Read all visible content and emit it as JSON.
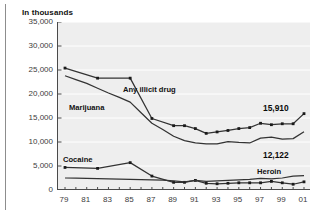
{
  "figure": {
    "title": "In thousands",
    "background": "#ffffff",
    "plot_background": "#eeeeee",
    "line_color": "#333333",
    "gridline_color": "#ffffff"
  },
  "annotations": [
    {
      "name": "any-illicit-drug",
      "label": "Any illicit drug"
    },
    {
      "name": "marijuana",
      "label": "Marijuana"
    },
    {
      "name": "cocaine",
      "label": "Cocaine"
    },
    {
      "name": "heroin",
      "label": "Heroin"
    }
  ],
  "end_labels": [
    {
      "name": "any-illicit-drug-value",
      "label": "15,910"
    },
    {
      "name": "marijuana-value",
      "label": "12,122"
    }
  ],
  "chart_data": {
    "type": "line",
    "title": "In thousands",
    "xlabel": "",
    "ylabel": "In thousands",
    "ylim": [
      0,
      35000
    ],
    "yticks": [
      0,
      5000,
      10000,
      15000,
      20000,
      25000,
      30000,
      35000
    ],
    "ytick_labels": [
      "0",
      "5,000",
      "10,000",
      "15,000",
      "20,000",
      "25,000",
      "30,000",
      "35,000"
    ],
    "grid": true,
    "legend": "inline-annotations",
    "x": [
      1979,
      1980,
      1981,
      1982,
      1983,
      1984,
      1985,
      1986,
      1987,
      1988,
      1989,
      1990,
      1991,
      1992,
      1993,
      1994,
      1995,
      1996,
      1997,
      1998,
      1999,
      2000,
      2001
    ],
    "xtick_labels": [
      "79",
      "",
      "81",
      "",
      "83",
      "",
      "85",
      "",
      "87",
      "",
      "89",
      "",
      "91",
      "",
      "93",
      "",
      "95",
      "",
      "97",
      "",
      "99",
      "",
      "01"
    ],
    "series": [
      {
        "name": "Any illicit drug",
        "markers": true,
        "values": [
          25400,
          null,
          null,
          23300,
          null,
          null,
          23300,
          null,
          14900,
          null,
          13400,
          13400,
          12800,
          11800,
          12100,
          12400,
          12800,
          13000,
          13900,
          13600,
          13800,
          13800,
          15910
        ],
        "observed": {
          "1979": 25400,
          "1982": 23300,
          "1985": 23300,
          "1988": 14900,
          "1990": 13400,
          "1991": 12800,
          "1992": 11800,
          "1993": 12100,
          "1994": 12400,
          "1995": 12800,
          "1996": 13000,
          "1997": 13900,
          "1998": 13600,
          "1999": 13800,
          "2000": 13800,
          "2001": 15910
        }
      },
      {
        "name": "Marijuana",
        "markers": false,
        "values": [
          23800,
          23000,
          22200,
          21200,
          20200,
          19300,
          18300,
          16100,
          13900,
          12600,
          11200,
          10300,
          9800,
          9600,
          9600,
          10100,
          9900,
          9800,
          10800,
          11000,
          10600,
          10700,
          12122
        ],
        "observed": {
          "1979": 23800,
          "1985": 18300,
          "1988": 12600,
          "1992": 9600,
          "1994": 10100,
          "1997": 10800,
          "2001": 12122
        }
      },
      {
        "name": "Cocaine",
        "markers": true,
        "values": [
          4700,
          null,
          null,
          4500,
          null,
          null,
          5700,
          null,
          2900,
          null,
          1600,
          1600,
          2000,
          1400,
          1300,
          1400,
          1500,
          1500,
          1500,
          1800,
          1500,
          1200,
          1700
        ],
        "observed": {
          "1979": 4700,
          "1982": 4500,
          "1985": 5700,
          "1988": 2900,
          "1990": 1600,
          "1991": 2000,
          "1992": 1400,
          "1993": 1300,
          "1994": 1400,
          "1995": 1500,
          "1996": 1500,
          "1997": 1500,
          "1998": 1800,
          "1999": 1500,
          "2000": 1200,
          "2001": 1700
        }
      },
      {
        "name": "Heroin",
        "markers": false,
        "values": [
          2500,
          2450,
          2400,
          2350,
          2300,
          2250,
          2200,
          2150,
          2100,
          2050,
          1900,
          1700,
          2000,
          1800,
          1900,
          2000,
          2100,
          2200,
          2400,
          2300,
          2500,
          2900,
          3000
        ],
        "observed": {
          "1979": 2500,
          "1985": 2200,
          "1990": 1700,
          "1991": 2000,
          "1995": 2100,
          "1999": 2500,
          "2000": 2900,
          "2001": 3000
        }
      }
    ]
  }
}
